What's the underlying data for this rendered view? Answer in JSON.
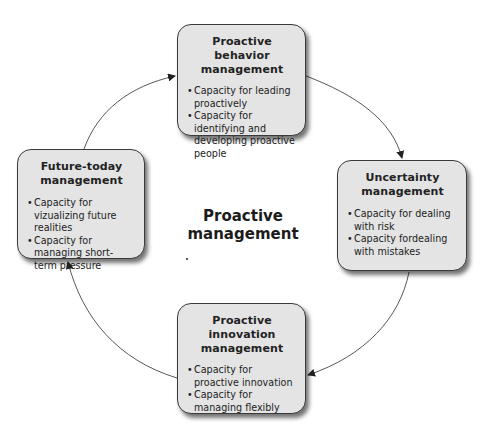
{
  "center": {
    "title": "Proactive management"
  },
  "boxes": {
    "top": {
      "title": "Proactive behavior management",
      "bullets": [
        "Capacity for leading proactively",
        "Capacity for identifying and developing proactive people"
      ]
    },
    "right": {
      "title": "Uncertainty management",
      "bullets": [
        "Capacity for dealing with risk",
        "Capacity fordealing with mistakes"
      ]
    },
    "bottom": {
      "title": "Proactive innovation management",
      "bullets": [
        "Capacity for proactive innovation",
        "Capacity for managing flexibly"
      ]
    },
    "left": {
      "title": "Future-today management",
      "bullets": [
        "Capacity for vizualizing future realities",
        "Capacity for managing short-term pressure"
      ]
    }
  },
  "cycle": {
    "direction": "clockwise",
    "order": [
      "top",
      "right",
      "bottom",
      "left"
    ],
    "arrow_color": "#333333",
    "box_fill": "#e4e4e4"
  }
}
